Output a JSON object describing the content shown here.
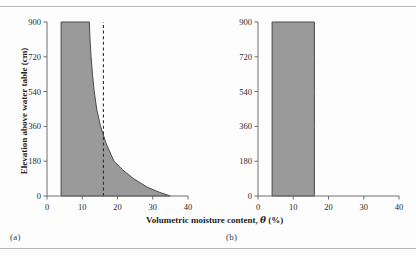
{
  "figure": {
    "background_color": "#fdfdfd",
    "rule_color": "#b9b9b9",
    "fill_color": "#9a9a9a",
    "outline_color": "#4a4a4a",
    "axis_color": "#6e6e6e",
    "dashed_line_color": "#2a2a2a"
  },
  "labels": {
    "xlabel_prefix": "Volumetric moisture content, ",
    "xlabel_theta": "θ",
    "xlabel_suffix": " (%)",
    "ylabel": "Elevation above water table (cm)",
    "caption_a": "(a)",
    "caption_b": "(b)"
  },
  "chart_data": [
    {
      "type": "area",
      "panel": "a",
      "title": "",
      "xlabel": "Volumetric moisture content, θ (%)",
      "ylabel": "Elevation above water table (cm)",
      "xlim": [
        0,
        40
      ],
      "ylim": [
        0,
        900
      ],
      "xticks": [
        0,
        10,
        20,
        30,
        40
      ],
      "yticks": [
        0,
        180,
        360,
        540,
        720,
        900
      ],
      "grid": false,
      "legend": null,
      "orientation": "horizontal-profile",
      "left_boundary_theta": 4,
      "series": [
        {
          "name": "Moisture retention profile",
          "elevation_cm": [
            900,
            810,
            720,
            630,
            540,
            450,
            360,
            270,
            180,
            135,
            90,
            45,
            20,
            0
          ],
          "theta_percent": [
            12.0,
            12.2,
            12.5,
            12.9,
            13.4,
            14.1,
            15.2,
            16.8,
            19.0,
            21.5,
            24.5,
            28.5,
            31.8,
            35.0
          ]
        }
      ],
      "annotations": [
        {
          "name": "field-capacity-line",
          "type": "vertical-dashed-line",
          "theta_percent": 16,
          "style": "dashed"
        }
      ]
    },
    {
      "type": "area",
      "panel": "b",
      "title": "",
      "xlabel": "Volumetric moisture content, θ (%)",
      "ylabel": "Elevation above water table (cm)",
      "xlim": [
        0,
        40
      ],
      "ylim": [
        0,
        900
      ],
      "xticks": [
        0,
        10,
        20,
        30,
        40
      ],
      "yticks": [
        0,
        180,
        360,
        540,
        720,
        900
      ],
      "grid": false,
      "legend": null,
      "orientation": "horizontal-profile",
      "left_boundary_theta": 4,
      "series": [
        {
          "name": "Uniform moisture profile",
          "elevation_cm": [
            900,
            720,
            540,
            360,
            180,
            0
          ],
          "theta_percent": [
            16,
            16,
            16,
            16,
            16,
            16
          ]
        }
      ],
      "annotations": []
    }
  ]
}
